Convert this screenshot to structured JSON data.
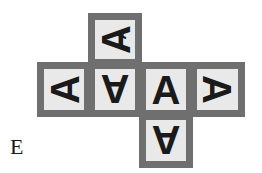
{
  "figure": {
    "label": "E",
    "type": "cube-net",
    "colors": {
      "background": "#ffffff",
      "cell_fill": "#e9e9e9",
      "cell_border": "#6f6f6f",
      "glyph": "#1a1a1a"
    },
    "cells": [
      {
        "id": "top",
        "position": "top",
        "row": 1,
        "column": 2,
        "glyph": "A",
        "rotation_deg": 270,
        "extra_glyph": "A",
        "extra_rotation_deg": 270
      },
      {
        "id": "mid-1",
        "position": "middle-left",
        "row": 2,
        "column": 1,
        "glyph": "A",
        "rotation_deg": 270
      },
      {
        "id": "mid-2",
        "position": "middle-center-left",
        "row": 2,
        "column": 2,
        "glyph": "A",
        "rotation_deg": 180
      },
      {
        "id": "mid-3",
        "position": "middle-center-right",
        "row": 2,
        "column": 3,
        "glyph": "A",
        "rotation_deg": 0
      },
      {
        "id": "mid-4",
        "position": "middle-right",
        "row": 2,
        "column": 4,
        "glyph": "A",
        "rotation_deg": 90
      },
      {
        "id": "bottom",
        "position": "bottom",
        "row": 3,
        "column": 3,
        "glyph": "A",
        "rotation_deg": 180
      }
    ]
  }
}
